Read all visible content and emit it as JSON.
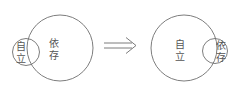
{
  "diagram": {
    "stroke_color": "#6e6e6e",
    "text_color": "#555555",
    "before": {
      "large_circle_label_line1": "依",
      "large_circle_label_line2": "存",
      "small_circle_label_line1": "自",
      "small_circle_label_line2": "立"
    },
    "arrow": {
      "symbol": "⟹"
    },
    "after": {
      "large_circle_label_line1": "自",
      "large_circle_label_line2": "立",
      "small_circle_label_line1": "依",
      "small_circle_label_line2": "存"
    }
  }
}
